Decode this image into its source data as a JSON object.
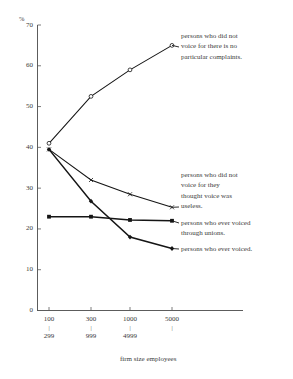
{
  "chart_data": {
    "type": "line",
    "title": "",
    "xlabel": "firm size employees",
    "ylabel": "%",
    "ylim": [
      0,
      70
    ],
    "grid": false,
    "legend_position": "inline-annotations",
    "categories": [
      "100\n|\n299",
      "300\n|\n999",
      "1000\n|\n4999",
      "5000\n|"
    ],
    "x_tick_labels": [
      {
        "top": "100",
        "bar": "|",
        "bottom": "299"
      },
      {
        "top": "300",
        "bar": "|",
        "bottom": "999"
      },
      {
        "top": "1000",
        "bar": "|",
        "bottom": "4999"
      },
      {
        "top": "5000",
        "bar": "|",
        "bottom": ""
      }
    ],
    "y_tick_labels": [
      "70",
      "60",
      "50",
      "40",
      "30",
      "20",
      "10",
      "0"
    ],
    "y_tick_values": [
      70,
      60,
      50,
      40,
      30,
      20,
      10,
      0
    ],
    "series": [
      {
        "name": "persons who did not voice for there is no particular complaints.",
        "marker": "open-circle",
        "values": [
          41,
          52.5,
          59,
          65
        ]
      },
      {
        "name": "persons who did not voice for they thought voice was useless.",
        "marker": "x",
        "values": [
          39.5,
          32,
          28.5,
          25.3
        ]
      },
      {
        "name": "persons who ever voiced through unions.",
        "marker": "filled-square",
        "values": [
          23,
          23,
          22.2,
          22
        ]
      },
      {
        "name": "persons who ever voiced.",
        "marker": "filled-diamond",
        "values": [
          39.5,
          26.8,
          18,
          15.2
        ]
      }
    ],
    "annotations": [
      {
        "id": "ann-no-complaints",
        "lines": [
          "persons who did not",
          "voice for there is no",
          "particular complaints."
        ]
      },
      {
        "id": "ann-useless",
        "lines": [
          "persons who did not",
          "voice for they",
          "thought voice was",
          "useless."
        ]
      },
      {
        "id": "ann-unions",
        "lines": [
          "persons who ever voiced",
          "through unions."
        ]
      },
      {
        "id": "ann-ever-voiced",
        "lines": [
          "persons who ever voiced."
        ]
      }
    ],
    "colors": {
      "axis": "#4a4a4a",
      "line": "#151515",
      "text": "#3a3a3a",
      "background": "#ffffff"
    }
  }
}
